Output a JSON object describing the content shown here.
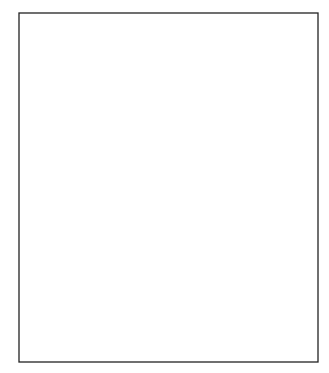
{
  "chart_data": {
    "type": "line",
    "title": "",
    "xlabel": "",
    "ylabel": "",
    "ylim": [
      -3,
      4
    ],
    "grid": {
      "horizontal": true,
      "style": "dashed",
      "color": "#c8c8c8"
    },
    "legend": null,
    "y_ticks": [
      "4",
      "3",
      "2",
      "1",
      "0",
      "-1",
      "-2",
      "-3"
    ],
    "line_color": "#1a1a1a",
    "series": [
      {
        "name": "series",
        "points": [
          [
            23,
            0.75
          ],
          [
            26,
            -0.4
          ],
          [
            29,
            1.7
          ],
          [
            33,
            -2.3
          ],
          [
            36,
            0.15
          ],
          [
            39,
            -0.6
          ],
          [
            41,
            1.2
          ],
          [
            44,
            -1.4
          ],
          [
            46,
            1.0
          ],
          [
            49,
            -0.7
          ],
          [
            52,
            0.2
          ],
          [
            54,
            0.4
          ],
          [
            58,
            -0.55
          ],
          [
            61,
            0.0
          ],
          [
            65,
            -1.0
          ],
          [
            67,
            1.0
          ],
          [
            69,
            1.75
          ],
          [
            74,
            -1.3
          ],
          [
            79,
            1.0
          ],
          [
            82,
            -1.4
          ],
          [
            88,
            -0.6
          ],
          [
            91,
            -0.2
          ],
          [
            95,
            -0.25
          ],
          [
            97,
            -0.4
          ],
          [
            99,
            0.3
          ],
          [
            101,
            0.15
          ],
          [
            104,
            0.65
          ],
          [
            108,
            -1.6
          ],
          [
            110,
            2.8
          ],
          [
            114,
            0.9
          ],
          [
            116,
            2.2
          ],
          [
            120,
            -2.1
          ],
          [
            127,
            1.8
          ],
          [
            130,
            1.5
          ],
          [
            138,
            0.5
          ],
          [
            140,
            -0.95
          ],
          [
            143,
            1.2
          ],
          [
            145,
            0.7
          ],
          [
            148,
            1.2
          ],
          [
            150,
            1.45
          ],
          [
            154,
            1.6
          ],
          [
            159,
            -0.8
          ],
          [
            161,
            0.65
          ],
          [
            164,
            -0.8
          ],
          [
            169,
            0.25
          ],
          [
            172,
            -0.5
          ],
          [
            174,
            -0.5
          ],
          [
            177,
            0.25
          ],
          [
            182,
            -0.8
          ],
          [
            183,
            1.9
          ],
          [
            186,
            1.85
          ],
          [
            189,
            -0.75
          ],
          [
            194,
            2.1
          ],
          [
            197,
            0.5
          ],
          [
            199,
            1.4
          ],
          [
            205,
            -1.15
          ],
          [
            206,
            -1.2
          ],
          [
            210,
            0.7
          ],
          [
            212,
            0.0
          ],
          [
            213,
            0.2
          ],
          [
            214,
            0.05
          ],
          [
            218,
            -0.9
          ],
          [
            220,
            1.6
          ],
          [
            224,
            -2.0
          ],
          [
            228,
            1.4
          ],
          [
            229,
            2.0
          ],
          [
            232,
            -0.5
          ],
          [
            235,
            1.6
          ],
          [
            239,
            -1.55
          ],
          [
            241,
            2.1
          ],
          [
            245,
            0.3
          ],
          [
            246,
            0.3
          ],
          [
            250,
            -0.8
          ],
          [
            252,
            1.4
          ],
          [
            255,
            1.7
          ],
          [
            259,
            -1.9
          ],
          [
            267,
            0.6
          ],
          [
            268,
            0.45
          ],
          [
            270,
            0.2
          ],
          [
            272,
            1.2
          ],
          [
            276,
            0.05
          ],
          [
            278,
            1.75
          ],
          [
            281,
            1.05
          ],
          [
            283,
            2.1
          ],
          [
            287,
            0.35
          ],
          [
            289,
            0.35
          ],
          [
            291,
            0.3
          ],
          [
            296,
            -0.95
          ],
          [
            298,
            -0.3
          ],
          [
            300,
            -0.95
          ],
          [
            305,
            -0.75
          ],
          [
            307,
            0.75
          ],
          [
            313,
            -2.4
          ],
          [
            315,
            -2.0
          ]
        ]
      }
    ]
  }
}
